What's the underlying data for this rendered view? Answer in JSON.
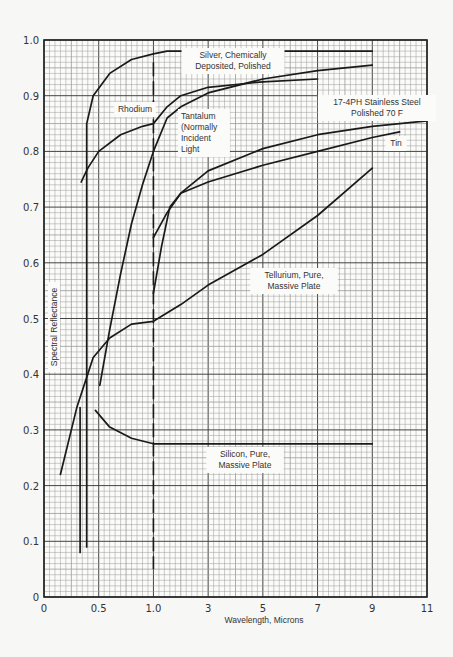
{
  "chart_data": {
    "type": "line",
    "title": "",
    "xlabel": "Wavelength, Microns",
    "ylabel": "Spectral Reflectance",
    "x_ticks": [
      "0",
      "0.5",
      "1.0",
      "3",
      "5",
      "7",
      "9",
      "11"
    ],
    "x_tick_values": [
      0,
      0.5,
      1.0,
      3,
      5,
      7,
      9,
      11
    ],
    "x_scale_note": "piecewise: 0-1.0 at 0.5 micron per major division, 1.0-11 at 2 microns per major division",
    "y_ticks": [
      "0",
      "0.1",
      "0.2",
      "0.3",
      "0.4",
      "0.5",
      "0.6",
      "0.7",
      "0.8",
      "0.9",
      "1.0"
    ],
    "ylim": [
      0,
      1.0
    ],
    "xlim": [
      0,
      11
    ],
    "grid": true,
    "annotations": [
      {
        "text": "Dashed vertical line at 1.0 micron (scale change)"
      }
    ],
    "series": [
      {
        "name": "Silver, Chemically Deposited, Polished",
        "label_lines": [
          "Silver, Chemically",
          "Deposited, Polished"
        ],
        "x": [
          0.39,
          0.39,
          0.39,
          0.45,
          0.6,
          0.8,
          1.0,
          1.5,
          3,
          5,
          7,
          9
        ],
        "y": [
          0.09,
          0.5,
          0.85,
          0.9,
          0.94,
          0.965,
          0.975,
          0.98,
          0.98,
          0.98,
          0.98,
          0.98
        ]
      },
      {
        "name": "Rhodium",
        "label_lines": [
          "Rhodium"
        ],
        "x": [
          0.34,
          0.4,
          0.5,
          0.7,
          0.9,
          1.0,
          1.5,
          2,
          3,
          5,
          7
        ],
        "y": [
          0.745,
          0.77,
          0.8,
          0.83,
          0.845,
          0.85,
          0.88,
          0.9,
          0.915,
          0.925,
          0.93
        ]
      },
      {
        "name": "Tantalum (Normally Incident Light)",
        "label_lines": [
          "Tantalum",
          "(Normally",
          "Incident",
          "Light"
        ],
        "x": [
          0.51,
          0.6,
          0.7,
          0.8,
          0.9,
          1.0,
          1.5,
          2,
          3,
          5,
          7,
          9
        ],
        "y": [
          0.38,
          0.48,
          0.58,
          0.67,
          0.74,
          0.8,
          0.86,
          0.88,
          0.905,
          0.93,
          0.945,
          0.955
        ]
      },
      {
        "name": "17-4PH Stainless Steel Polished 70 F",
        "label_lines": [
          "17-4PH Stainless Steel",
          "Polished 70 F"
        ],
        "x": [
          1.0,
          1.5,
          2,
          3,
          5,
          7,
          9,
          11
        ],
        "y": [
          0.645,
          0.69,
          0.725,
          0.765,
          0.805,
          0.83,
          0.845,
          0.855
        ]
      },
      {
        "name": "Tin",
        "label_lines": [
          "Tin"
        ],
        "x": [
          1.0,
          1.3,
          1.6,
          2,
          3,
          5,
          7,
          9,
          10
        ],
        "y": [
          0.545,
          0.63,
          0.7,
          0.725,
          0.745,
          0.775,
          0.8,
          0.825,
          0.835
        ]
      },
      {
        "name": "Tellurium, Pure, Massive Plate",
        "label_lines": [
          "Tellurium, Pure,",
          "Massive Plate"
        ],
        "x": [
          0.15,
          0.3,
          0.45,
          0.6,
          0.8,
          1.0,
          2,
          3,
          5,
          7,
          9
        ],
        "y": [
          0.22,
          0.34,
          0.43,
          0.465,
          0.49,
          0.495,
          0.525,
          0.56,
          0.615,
          0.685,
          0.77
        ]
      },
      {
        "name": "Silicon, Pure, Massive Plate",
        "label_lines": [
          "Silicon, Pure,",
          "Massive Plate"
        ],
        "x": [
          0.47,
          0.6,
          0.8,
          1.0,
          3,
          5,
          7,
          9
        ],
        "y": [
          0.335,
          0.305,
          0.285,
          0.275,
          0.275,
          0.275,
          0.275,
          0.275
        ]
      },
      {
        "name": "Short vertical segment near 0.33 micron",
        "label_lines": [],
        "x": [
          0.33,
          0.33
        ],
        "y": [
          0.34,
          0.08
        ]
      }
    ]
  },
  "colors": {
    "background": "#f7f7f5",
    "grid_minor": "#9a9a9a",
    "grid_major": "#444444",
    "curve": "#1a1a1a",
    "text": "#333333"
  }
}
